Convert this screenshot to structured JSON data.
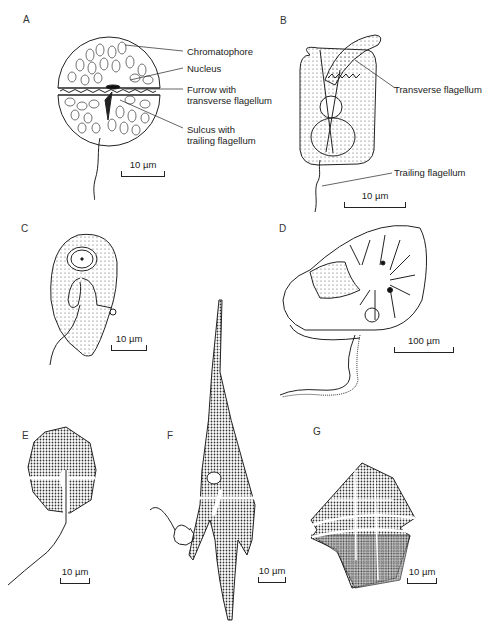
{
  "figure": {
    "panels": [
      {
        "id": "A",
        "labels": [
          "Chromatophore",
          "Nucleus",
          "Furrow with",
          "transverse flagellum",
          "Sulcus with",
          "trailing flagellum"
        ],
        "scale": "10 µm"
      },
      {
        "id": "B",
        "labels": [
          "Transverse flagellum",
          "Trailing flagellum"
        ],
        "scale": "10 µm"
      },
      {
        "id": "C",
        "labels": [],
        "scale": "10 µm"
      },
      {
        "id": "D",
        "labels": [],
        "scale": "100 µm"
      },
      {
        "id": "E",
        "labels": [],
        "scale": "10 µm"
      },
      {
        "id": "F",
        "labels": [],
        "scale": "10 µm"
      },
      {
        "id": "G",
        "labels": [],
        "scale": "10 µm"
      }
    ]
  }
}
